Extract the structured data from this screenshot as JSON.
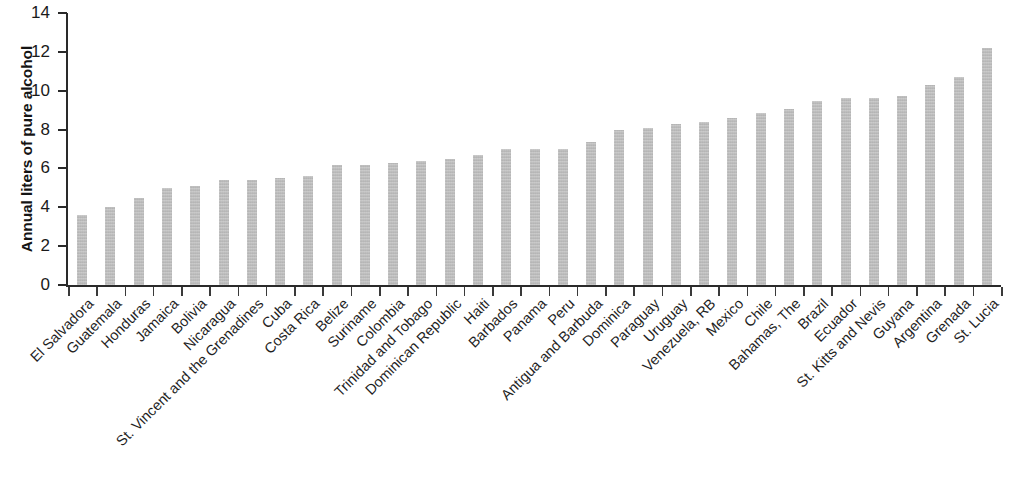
{
  "chart_data": {
    "type": "bar",
    "title": "",
    "subtitle": "",
    "xlabel": "",
    "ylabel": "Annual liters of pure alcohol",
    "ylim": [
      0,
      14
    ],
    "yticks": [
      0,
      2,
      4,
      6,
      8,
      10,
      12,
      14
    ],
    "grid": false,
    "legend": null,
    "orientation": "vertical",
    "bar_color": "#b9b9b9",
    "axis_color": "#2a2a2a",
    "categories": [
      "El Salvadora",
      "Guatemala",
      "Honduras",
      "Jamaica",
      "Bolivia",
      "Nicaragua",
      "St. Vincent and the Grenadines",
      "Cuba",
      "Costa Rica",
      "Belize",
      "Suriname",
      "Colombia",
      "Trinidad and Tobago",
      "Dominican Republic",
      "Haiti",
      "Barbados",
      "Panama",
      "Peru",
      "Antigua and Barbuda",
      "Dominica",
      "Paraguay",
      "Uruguay",
      "Venezuela, RB",
      "Mexico",
      "Chile",
      "Bahamas, The",
      "Brazil",
      "Ecuador",
      "St. Kitts and Nevis",
      "Guyana",
      "Argentina",
      "Grenada",
      "St. Lucia"
    ],
    "values": [
      3.6,
      4.0,
      4.5,
      5.0,
      5.1,
      5.4,
      5.4,
      5.5,
      5.6,
      6.2,
      6.2,
      6.3,
      6.4,
      6.5,
      6.7,
      7.0,
      7.0,
      7.0,
      7.35,
      8.0,
      8.1,
      8.3,
      8.4,
      8.6,
      8.85,
      9.05,
      9.45,
      9.6,
      9.65,
      9.75,
      10.3,
      10.7,
      12.2
    ]
  },
  "axis": {
    "y_tick_labels": [
      "14",
      "12",
      "10",
      "8",
      "6",
      "4",
      "2",
      "0"
    ]
  }
}
